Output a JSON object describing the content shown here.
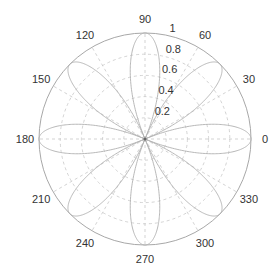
{
  "chart_data": {
    "type": "line",
    "subtype": "polar",
    "title": "",
    "equation": "r = |cos(4θ)|",
    "series": [
      {
        "name": "rose",
        "function": "abs(cos(4*theta))",
        "theta_range_deg": [
          0,
          360
        ],
        "petals": 8,
        "petal_axes_deg": [
          0,
          45,
          90,
          135,
          180,
          225,
          270,
          315
        ],
        "max_r": 1
      }
    ],
    "angle_ticks": [
      0,
      30,
      60,
      90,
      120,
      150,
      180,
      210,
      240,
      270,
      300,
      330
    ],
    "angle_tick_labels": [
      "0",
      "30",
      "60",
      "90",
      "120",
      "150",
      "180",
      "210",
      "240",
      "270",
      "300",
      "330"
    ],
    "r_ticks": [
      0.2,
      0.4,
      0.6,
      0.8,
      1
    ],
    "r_tick_labels": [
      "0.2",
      "0.4",
      "0.6",
      "0.8",
      "1"
    ],
    "rlim": [
      0,
      1
    ],
    "grid": true,
    "legend": "none",
    "colors": {
      "curve": "#b0b0b0",
      "grid": "#c8c8c8",
      "outer": "#a8a8a8",
      "text": "#333333"
    }
  }
}
